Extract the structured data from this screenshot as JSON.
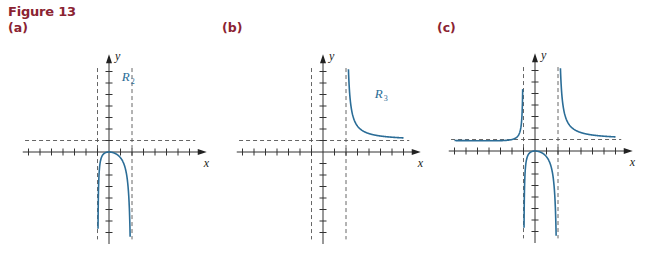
{
  "figure": {
    "title": "Figure 13",
    "panels": [
      {
        "label": "(a)"
      },
      {
        "label": "(b)"
      },
      {
        "label": "(c)"
      }
    ]
  },
  "colors": {
    "title": "#8b2332",
    "curve": "#2b6d97",
    "axis": "#333333",
    "asymptote": "#555555"
  },
  "chart_data": [
    {
      "type": "line",
      "title": "(a)",
      "function": "R(x) = x^2 / ((x+1)(x-2))",
      "xlabel": "x",
      "ylabel": "y",
      "series": [
        {
          "name": "R_2",
          "label": "R",
          "subscript": "2",
          "domain": [
            -1,
            2
          ],
          "description": "middle branch, max 0 at origin, falls to -infinity at both asymptotes"
        }
      ],
      "asymptotes": {
        "vertical": [
          -1,
          2
        ],
        "horizontal": [
          1
        ]
      },
      "xlim": [
        -7.5,
        8.5
      ],
      "ylim": [
        -8,
        8.5
      ],
      "tick_step": 1,
      "grid": false,
      "label_pos": {
        "x": 1.1,
        "y": 6.2
      }
    },
    {
      "type": "line",
      "title": "(b)",
      "function": "R(x) = x^2 / ((x+1)(x-2))",
      "xlabel": "x",
      "ylabel": "y",
      "series": [
        {
          "name": "R_3",
          "label": "R",
          "subscript": "3",
          "domain": [
            2,
            7
          ],
          "description": "right branch, decreasing from +infinity toward y = 1"
        }
      ],
      "asymptotes": {
        "vertical": [
          -1,
          2
        ],
        "horizontal": [
          1
        ]
      },
      "xlim": [
        -7.5,
        8.5
      ],
      "ylim": [
        -8,
        8.5
      ],
      "tick_step": 1,
      "grid": false,
      "label_pos": {
        "x": 4.5,
        "y": 4.7
      }
    },
    {
      "type": "line",
      "title": "(c)",
      "function": "R(x) = x^2 / ((x+1)(x-2))",
      "xlabel": "x",
      "ylabel": "y",
      "series": [
        {
          "name": "R_1",
          "domain": [
            -7,
            -1
          ],
          "description": "left branch, ~1 rising to +infinity at x = -1"
        },
        {
          "name": "R_2",
          "domain": [
            -1,
            2
          ],
          "description": "middle branch"
        },
        {
          "name": "R_3",
          "domain": [
            2,
            7
          ],
          "description": "right branch"
        }
      ],
      "asymptotes": {
        "vertical": [
          -1,
          2
        ],
        "horizontal": [
          1
        ]
      },
      "xlim": [
        -7.5,
        8.5
      ],
      "ylim": [
        -8,
        8.5
      ],
      "tick_step": 1,
      "grid": false
    }
  ],
  "layout": {
    "unit_px": 11.5,
    "origins": [
      [
        109,
        152
      ],
      [
        323,
        152
      ],
      [
        535,
        151
      ]
    ],
    "label_x": [
      8,
      222,
      437
    ]
  }
}
